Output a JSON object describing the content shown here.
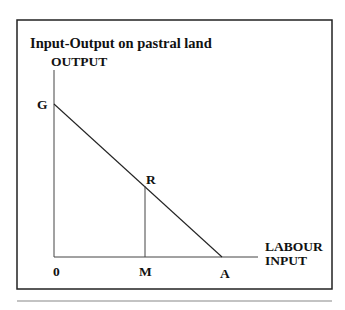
{
  "title": "Input-Output on pastral land",
  "y_axis_label": "OUTPUT",
  "x_axis_label": [
    "LABOUR",
    "INPUT"
  ],
  "points": {
    "G": "G",
    "R": "R",
    "origin": "0",
    "M": "M",
    "A": "A"
  },
  "colors": {
    "stroke": "#222222",
    "text": "#111111",
    "rule": "#888888"
  }
}
